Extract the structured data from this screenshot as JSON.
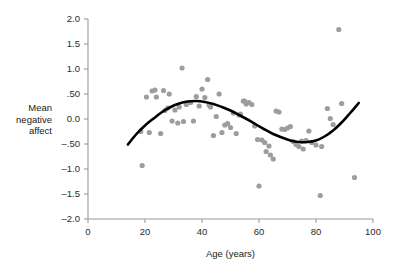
{
  "chart_data": {
    "type": "scatter",
    "title": "",
    "xlabel": "Age (years)",
    "ylabel": "Mean negative affect",
    "ylabel_lines": [
      "Mean",
      "negative",
      "affect"
    ],
    "xlim": [
      0,
      100
    ],
    "ylim": [
      -2.0,
      2.0
    ],
    "grid": false,
    "legend": null,
    "xticks": [
      0,
      20,
      40,
      60,
      80,
      100
    ],
    "xtick_labels": [
      "0",
      "20",
      "40",
      "60",
      "80",
      "100"
    ],
    "yticks": [
      2.0,
      1.5,
      1.0,
      0.5,
      0.0,
      -0.5,
      -1.0,
      -1.5,
      -2.0
    ],
    "ytick_labels": [
      "2.0",
      "1.5",
      "1.0",
      ".50",
      "0.0",
      "–.50",
      "–1.0",
      "–1.5",
      "–2.0"
    ],
    "point_color": "#9d9d9d",
    "curve_color": "#000000",
    "axis_color": "#9a9a9a",
    "x": [
      18.5,
      19.0,
      20.5,
      21.5,
      22.5,
      23.5,
      24.0,
      25.5,
      26.5,
      27.0,
      28.0,
      28.5,
      29.5,
      30.5,
      31.5,
      32.0,
      33.0,
      33.5,
      34.5,
      35.0,
      36.0,
      37.0,
      38.0,
      39.0,
      40.0,
      41.0,
      42.0,
      42.5,
      43.0,
      44.0,
      45.0,
      46.0,
      47.0,
      48.0,
      49.0,
      50.0,
      51.0,
      52.0,
      53.0,
      53.5,
      54.5,
      55.0,
      55.5,
      56.5,
      57.5,
      58.5,
      59.5,
      60.0,
      61.0,
      62.0,
      62.5,
      63.5,
      64.0,
      65.0,
      66.0,
      67.0,
      68.0,
      69.0,
      70.0,
      71.0,
      72.0,
      73.0,
      74.0,
      75.0,
      75.5,
      76.5,
      77.5,
      78.5,
      80.0,
      81.5,
      82.0,
      84.0,
      85.0,
      86.0,
      88.0,
      89.0,
      93.5
    ],
    "y": [
      -0.25,
      -0.93,
      0.44,
      -0.27,
      0.56,
      0.58,
      0.44,
      -0.29,
      0.57,
      0.17,
      0.22,
      0.5,
      -0.04,
      0.18,
      -0.08,
      0.24,
      1.02,
      -0.05,
      0.29,
      0.32,
      0.33,
      -0.04,
      0.45,
      0.26,
      0.6,
      0.43,
      0.79,
      0.28,
      0.24,
      -0.33,
      0.05,
      0.5,
      -0.27,
      -0.12,
      -0.09,
      -0.17,
      0.12,
      -0.29,
      0.08,
      0.1,
      0.36,
      0.36,
      0.3,
      0.33,
      0.29,
      -0.14,
      -0.41,
      -1.34,
      -0.42,
      -0.47,
      -0.65,
      -0.54,
      -0.72,
      -0.8,
      0.16,
      0.14,
      -0.2,
      -0.21,
      -0.18,
      -0.15,
      -0.45,
      -0.51,
      -0.55,
      -0.44,
      -0.6,
      -0.43,
      -0.24,
      -0.47,
      -0.52,
      -1.53,
      -0.55,
      0.21,
      0.01,
      -0.11,
      1.79,
      0.31,
      -1.17
    ],
    "fit_curve": {
      "label": "cubic trend line",
      "x": [
        14,
        17,
        20,
        23,
        26,
        29,
        32,
        35,
        38,
        41,
        44,
        47,
        50,
        53,
        56,
        59,
        62,
        65,
        68,
        71,
        74,
        77,
        80,
        83,
        86,
        89,
        92,
        95
      ],
      "y": [
        -0.51,
        -0.3,
        -0.13,
        0.01,
        0.14,
        0.24,
        0.31,
        0.35,
        0.36,
        0.34,
        0.3,
        0.24,
        0.17,
        0.08,
        -0.01,
        -0.11,
        -0.21,
        -0.3,
        -0.37,
        -0.43,
        -0.46,
        -0.46,
        -0.43,
        -0.35,
        -0.23,
        -0.07,
        0.12,
        0.32
      ]
    }
  },
  "geometry": {
    "plot_left": 88,
    "plot_right": 373,
    "plot_top": 19,
    "plot_bottom": 219,
    "point_radius": 2.6
  }
}
